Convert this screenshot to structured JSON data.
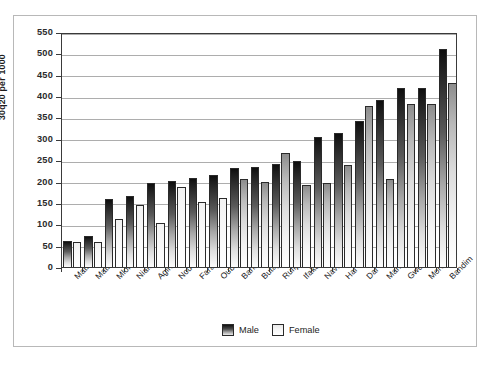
{
  "chart_data": {
    "type": "bar",
    "title": "",
    "xlabel": "",
    "ylabel": "30q20 per 1000",
    "ylim": [
      0,
      550
    ],
    "ytick_step": 50,
    "yticks": [
      0,
      50,
      100,
      150,
      200,
      250,
      300,
      350,
      400,
      450,
      500,
      550
    ],
    "grid": true,
    "legend_position": "bottom-center",
    "categories": [
      "Matlab treat.",
      "Matlab comp.",
      "Mlomp",
      "Niakhar",
      "Agincourt",
      "Nouna",
      "Farafenni",
      "Oubritenga",
      "Bandafassi",
      "Butajira",
      "Rufiji",
      "Ifakara",
      "Navrongo",
      "Hai",
      "Dar es Salaam",
      "Manhiça",
      "Gwembe",
      "Morogoro",
      "Bandim"
    ],
    "series": [
      {
        "name": "Male",
        "values": [
          62,
          72,
          160,
          166,
          197,
          202,
          208,
          216,
          232,
          235,
          242,
          248,
          305,
          314,
          341,
          392,
          418,
          418,
          511
        ]
      },
      {
        "name": "Female",
        "values": [
          59,
          59,
          112,
          145,
          103,
          187,
          153,
          161,
          205,
          199,
          267,
          192,
          197,
          238,
          378,
          206,
          382,
          381,
          430
        ]
      }
    ]
  },
  "legend": {
    "items": [
      {
        "label": "Male",
        "swatch": "male"
      },
      {
        "label": "Female",
        "swatch": "female"
      }
    ]
  }
}
